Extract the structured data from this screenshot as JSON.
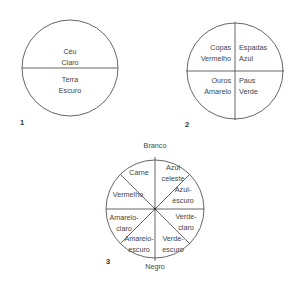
{
  "figures": [
    {
      "id": "figure-1",
      "number": "1",
      "type": "circle-bisected-horizontal",
      "sections": [
        {
          "name": "ceu",
          "text": "Céu\nClaro"
        },
        {
          "name": "terra",
          "text": "Terra\nEscuro"
        }
      ]
    },
    {
      "id": "figure-2",
      "number": "2",
      "type": "circle-quartered",
      "sections": [
        {
          "name": "copas",
          "text": "Copas\nVermelho"
        },
        {
          "name": "espadas",
          "text": "Espadas\nAzul"
        },
        {
          "name": "ouros",
          "text": "Ouros\nAmarelo"
        },
        {
          "name": "paus",
          "text": "Paus\nVerde"
        }
      ]
    },
    {
      "id": "figure-3",
      "number": "3",
      "type": "circle-eight-sectors",
      "pole_top": "Branco",
      "pole_bottom": "Negro",
      "sections": [
        {
          "name": "carne",
          "text": "Carne"
        },
        {
          "name": "azul-celeste",
          "text": "Azul\nceleste"
        },
        {
          "name": "vermelho",
          "text": "Vermelho"
        },
        {
          "name": "azul-escuro",
          "text": "Azul-\nescuro"
        },
        {
          "name": "amarelo-claro",
          "text": "Amarelo-\nclaro"
        },
        {
          "name": "verde-claro",
          "text": "Verde-\nclaro"
        },
        {
          "name": "amarelo-escuro",
          "text": "Amarelo-\nescuro"
        },
        {
          "name": "verde-escuro",
          "text": "Verde-\nescuro"
        }
      ]
    }
  ],
  "style": {
    "stroke_color": "#555555",
    "text_color": "#444444",
    "background": "#ffffff"
  }
}
